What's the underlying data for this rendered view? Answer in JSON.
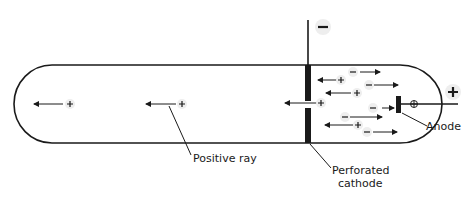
{
  "diagram": {
    "labels": {
      "positive_ray": "Positive ray",
      "perforated_cathode": "Perforated",
      "perforated_cathode_line2": "cathode",
      "anode": "Anode"
    },
    "terminals": {
      "cathode_sign": "−",
      "anode_sign": "+"
    },
    "particles": {
      "positive": "+",
      "negative": "–"
    },
    "colors": {
      "line": "#1a1a1a",
      "background": "#ffffff",
      "halo": "#eeeeee"
    }
  }
}
